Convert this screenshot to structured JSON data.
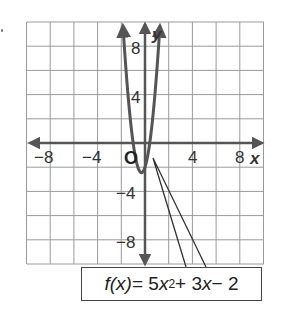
{
  "chart_data": {
    "type": "line",
    "title": "",
    "function": "f(x) = 5x^2 + 3x - 2",
    "xlabel": "x",
    "ylabel": "y",
    "xlim": [
      -10,
      10
    ],
    "ylim": [
      -10,
      10
    ],
    "grid": true,
    "grid_step": 2,
    "x_ticks": [
      -8,
      -4,
      4,
      8
    ],
    "x_tick_labels": [
      "−8",
      "−4",
      "4",
      "8"
    ],
    "y_ticks": [
      8,
      4,
      -4,
      -8
    ],
    "y_tick_labels": [
      "8",
      "4",
      "−4",
      "−8"
    ],
    "origin_label": "O",
    "series": [
      {
        "name": "f(x) = 5x² + 3x − 2",
        "x": [
          -1.878,
          -1.5,
          -1.0,
          -0.5,
          -0.3,
          0.0,
          0.4,
          0.8,
          1.0,
          1.278
        ],
        "y": [
          10.0,
          4.75,
          0.0,
          -2.25,
          -2.45,
          -2.0,
          0.0,
          3.6,
          6.0,
          10.0
        ]
      }
    ],
    "vertex": [
      -0.3,
      -2.45
    ],
    "annotations": [
      {
        "text": "f(x) = 5x² + 3x − 2",
        "type": "callout-box",
        "points_to": [
          0.7,
          -1.2
        ]
      }
    ]
  },
  "labels": {
    "x_axis": "x",
    "y_axis": "y",
    "origin": "O",
    "xticks": [
      "−8",
      "−4",
      "4",
      "8"
    ],
    "yticks": [
      "8",
      "4",
      "−4",
      "−8"
    ]
  },
  "formula": {
    "fx": "f(x)",
    "eq": " = 5",
    "var": "x",
    "exp": "2",
    "rest1": " + 3",
    "var2": "x",
    "rest2": " − 2"
  },
  "colors": {
    "grid": "#9a9a9a",
    "axis": "#555555",
    "curve": "#555555"
  }
}
